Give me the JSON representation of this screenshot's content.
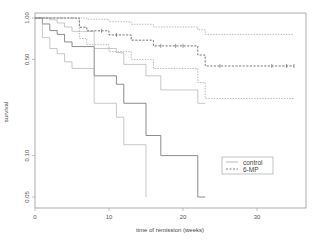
{
  "chart_data": {
    "type": "line",
    "subtype": "kaplan-meier step",
    "title": "",
    "xlabel": "time of remission (weeks)",
    "ylabel": "survival",
    "xlim": [
      0,
      36
    ],
    "ylim": [
      0.045,
      1.0
    ],
    "yscale": "log",
    "x_ticks": [
      0,
      10,
      20,
      30
    ],
    "x_tick_labels": [
      "0",
      "10",
      "20",
      "30"
    ],
    "y_ticks": [
      1.0,
      0.5,
      0.1,
      0.05
    ],
    "y_tick_labels": [
      "1.00",
      "0.50",
      "0.10",
      "0.05"
    ],
    "grid": false,
    "legend": {
      "position": "lower right",
      "entries": [
        {
          "label": "control",
          "style": "solid"
        },
        {
          "label": "6-MP",
          "style": "dashed"
        }
      ]
    },
    "series": [
      {
        "name": "control",
        "line": "estimate",
        "x": [
          0,
          1,
          2,
          3,
          4,
          5,
          8,
          11,
          12,
          15,
          17,
          22,
          23
        ],
        "y": [
          1.0,
          0.905,
          0.81,
          0.76,
          0.67,
          0.62,
          0.38,
          0.33,
          0.24,
          0.14,
          0.1,
          0.05,
          0.05
        ]
      },
      {
        "name": "control",
        "line": "lower CI",
        "x": [
          0,
          1,
          2,
          3,
          4,
          5,
          8,
          11,
          12,
          15
        ],
        "y": [
          1.0,
          0.72,
          0.6,
          0.55,
          0.48,
          0.43,
          0.24,
          0.19,
          0.12,
          0.05
        ]
      },
      {
        "name": "control",
        "line": "upper CI",
        "x": [
          0,
          1,
          2,
          3,
          4,
          5,
          8,
          11,
          12,
          15,
          17,
          22,
          23
        ],
        "y": [
          1.0,
          1.0,
          0.97,
          0.92,
          0.86,
          0.8,
          0.6,
          0.56,
          0.46,
          0.38,
          0.3,
          0.24,
          0.24
        ]
      },
      {
        "name": "6-MP",
        "line": "estimate",
        "x": [
          0,
          6,
          7,
          10,
          13,
          16,
          22,
          23,
          35
        ],
        "y": [
          1.0,
          0.857,
          0.807,
          0.753,
          0.69,
          0.627,
          0.538,
          0.448,
          0.448
        ],
        "censored_x": [
          9,
          11,
          17,
          19,
          20,
          25,
          32,
          34,
          35
        ]
      },
      {
        "name": "6-MP",
        "line": "lower CI",
        "x": [
          0,
          6,
          7,
          10,
          13,
          16,
          22,
          23,
          35
        ],
        "y": [
          1.0,
          0.71,
          0.64,
          0.57,
          0.5,
          0.43,
          0.34,
          0.26,
          0.26
        ]
      },
      {
        "name": "6-MP",
        "line": "upper CI",
        "x": [
          0,
          6,
          7,
          10,
          13,
          16,
          22,
          23,
          35
        ],
        "y": [
          1.0,
          1.0,
          0.98,
          0.94,
          0.9,
          0.86,
          0.82,
          0.76,
          0.76
        ]
      }
    ]
  }
}
